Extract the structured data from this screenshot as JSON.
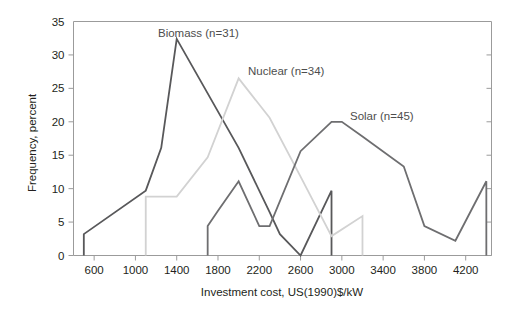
{
  "chart_data": {
    "type": "line",
    "title": "",
    "xlabel": "Investment cost, US(1990)$/kW",
    "ylabel": "Frequency, percent",
    "xlim": [
      400,
      4450
    ],
    "ylim": [
      0,
      35
    ],
    "xticks": [
      600,
      1000,
      1400,
      1800,
      2200,
      2600,
      3000,
      3400,
      3800,
      4200
    ],
    "yticks": [
      0,
      5,
      10,
      15,
      20,
      25,
      30,
      35
    ],
    "xtick_labels": [
      "600",
      "1000",
      "1400",
      "1800",
      "2200",
      "2600",
      "3000",
      "3400",
      "3800",
      "4200"
    ],
    "ytick_labels": [
      "0",
      "5",
      "10",
      "15",
      "20",
      "25",
      "30",
      "35"
    ],
    "grid": false,
    "legend_position": "inline-annotations",
    "series": [
      {
        "name": "Biomass (n=31)",
        "label": "Biomass (n=31)",
        "count": 31,
        "color": "#58585a",
        "width": 1.8,
        "x": [
          500,
          500,
          1100,
          1250,
          1400,
          2000,
          2300,
          2400,
          2600,
          2900,
          2900
        ],
        "y": [
          0,
          3.2,
          9.7,
          16.1,
          32.4,
          16.1,
          6.5,
          3.2,
          0,
          9.7,
          0
        ]
      },
      {
        "name": "Nuclear (n=34)",
        "label": "Nuclear (n=34)",
        "count": 34,
        "color": "#d2d2d2",
        "width": 1.8,
        "x": [
          1100,
          1100,
          1400,
          1700,
          2000,
          2300,
          2600,
          2900,
          3200,
          3200
        ],
        "y": [
          0,
          8.8,
          8.8,
          14.7,
          26.5,
          20.6,
          11.8,
          2.9,
          5.9,
          0
        ]
      },
      {
        "name": "Solar (n=45)",
        "label": "Solar (n=45)",
        "count": 45,
        "color": "#6e6e70",
        "width": 1.8,
        "x": [
          1700,
          1700,
          1800,
          2000,
          2200,
          2300,
          2600,
          2900,
          3000,
          3200,
          3600,
          3800,
          4100,
          4400,
          4400
        ],
        "y": [
          0,
          4.4,
          6.7,
          11.1,
          4.4,
          4.4,
          15.6,
          20.0,
          20.0,
          17.8,
          13.3,
          4.4,
          2.2,
          11.1,
          0
        ]
      }
    ],
    "annotations": [
      {
        "text": "Biomass (n=31)",
        "x_px": 158,
        "y_px": 37,
        "anchor": "start"
      },
      {
        "text": "Nuclear (n=34)",
        "x_px": 248,
        "y_px": 75,
        "anchor": "start"
      },
      {
        "text": "Solar (n=45)",
        "x_px": 350,
        "y_px": 120,
        "anchor": "start"
      }
    ]
  },
  "axes": {
    "x_title": "Investment cost, US(1990)$/kW",
    "y_title": "Frequency, percent"
  }
}
